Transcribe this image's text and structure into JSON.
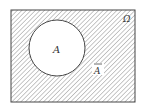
{
  "diagram": {
    "type": "venn",
    "universe_label": "Ω",
    "set_label": "A",
    "complement_label": "A",
    "complement_bar": true,
    "colors": {
      "stroke": "#444444",
      "hatch": "#9a9a9a",
      "background": "#ffffff"
    }
  }
}
